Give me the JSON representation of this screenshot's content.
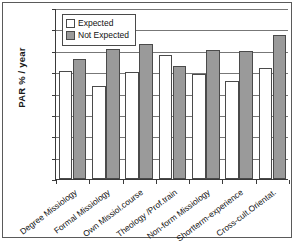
{
  "chart_data": {
    "type": "bar",
    "title": "",
    "xlabel": "",
    "ylabel": "PAR  % / year",
    "ylim": [
      0,
      8
    ],
    "ytick_labels": [
      "8",
      "7",
      "6",
      "5",
      "4",
      "3",
      "2",
      "1",
      "0"
    ],
    "ytick_values": [
      8,
      7,
      6,
      5,
      4,
      3,
      2,
      1,
      0
    ],
    "grid": true,
    "legend_position": "top-left",
    "categories": [
      "Degree Missiology",
      "Formal Missiology",
      "Own Missiol.course",
      "Theology /Prof.train",
      "Non-form Missiology",
      "Shortterm-experience",
      "Cross-cult.Orientat."
    ],
    "series": [
      {
        "name": "Expected",
        "color": "#ffffff",
        "values": [
          5.05,
          4.35,
          5.0,
          5.8,
          4.9,
          4.6,
          5.2
        ]
      },
      {
        "name": "Not Expected",
        "color": "#9a9a9a",
        "values": [
          5.6,
          6.1,
          6.3,
          5.3,
          6.05,
          6.0,
          6.75
        ]
      }
    ]
  },
  "legend": {
    "items": [
      {
        "label": "Expected"
      },
      {
        "label": "Not Expected"
      }
    ]
  },
  "colors": {
    "expected": "#ffffff",
    "not_expected": "#9a9a9a",
    "axis": "#3a3a3a",
    "grid": "#777777",
    "frame": "#5a5a5a"
  }
}
